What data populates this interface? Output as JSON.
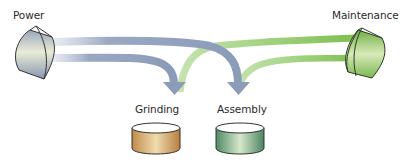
{
  "diagram": {
    "type": "resource-flow",
    "sources": [
      {
        "id": "power",
        "label": "Power",
        "color": "#9aa8c2"
      },
      {
        "id": "maintenance",
        "label": "Maintenance",
        "color": "#9fcf78"
      }
    ],
    "targets": [
      {
        "id": "grinding",
        "label": "Grinding",
        "color": "#c99a5a"
      },
      {
        "id": "assembly",
        "label": "Assembly",
        "color": "#5f9a78"
      }
    ],
    "flows": [
      {
        "from": "power",
        "to": "grinding",
        "color": "#9aa8c2"
      },
      {
        "from": "power",
        "to": "assembly",
        "color": "#9aa8c2"
      },
      {
        "from": "maintenance",
        "to": "grinding",
        "color": "#9fcf78"
      },
      {
        "from": "maintenance",
        "to": "assembly",
        "color": "#9fcf78"
      }
    ]
  }
}
